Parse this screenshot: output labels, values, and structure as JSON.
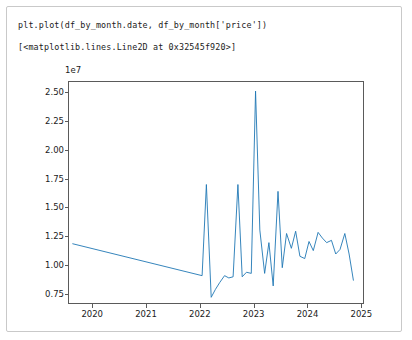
{
  "cell": {
    "input_line": "plt.plot(df_by_month.date, df_by_month['price'])",
    "output_line": "[<matplotlib.lines.Line2D at 0x32545f920>]"
  },
  "figure": {
    "offset_label": "1e7",
    "line_color": "#1f77b4",
    "axis_color": "#5a5a5a",
    "background": "#ffffff"
  },
  "chart_data": {
    "type": "line",
    "title": "",
    "xlabel": "",
    "ylabel": "",
    "offset_text": "1e7",
    "grid": false,
    "legend": null,
    "xtick_labels": [
      "2020",
      "2021",
      "2022",
      "2023",
      "2024",
      "2025"
    ],
    "xtick_values": [
      2020,
      2021,
      2022,
      2023,
      2024,
      2025
    ],
    "ytick_labels": [
      "0.75",
      "1.00",
      "1.25",
      "1.50",
      "1.75",
      "2.00",
      "2.25",
      "2.50"
    ],
    "ytick_values": [
      7500000,
      10000000,
      12500000,
      15000000,
      17500000,
      20000000,
      22500000,
      25000000
    ],
    "xlim": [
      2019.55,
      2025.05
    ],
    "ylim": [
      6600000,
      26000000
    ],
    "series": [
      {
        "name": "price",
        "x": [
          2019.62,
          2022.04,
          2022.12,
          2022.21,
          2022.29,
          2022.37,
          2022.46,
          2022.54,
          2022.62,
          2022.71,
          2022.79,
          2022.87,
          2022.96,
          2023.04,
          2023.12,
          2023.21,
          2023.29,
          2023.37,
          2023.46,
          2023.54,
          2023.62,
          2023.71,
          2023.79,
          2023.87,
          2023.96,
          2024.04,
          2024.12,
          2024.21,
          2024.29,
          2024.37,
          2024.46,
          2024.54,
          2024.62,
          2024.71,
          2024.79,
          2024.87
        ],
        "y": [
          11800000,
          9000000,
          17000000,
          7100000,
          7800000,
          8400000,
          9000000,
          8800000,
          8900000,
          17000000,
          8900000,
          9300000,
          9200000,
          25200000,
          13000000,
          9200000,
          11900000,
          8100000,
          16400000,
          9700000,
          12700000,
          11400000,
          12900000,
          10700000,
          10500000,
          12000000,
          11200000,
          12800000,
          12300000,
          11900000,
          12100000,
          10900000,
          11300000,
          12700000,
          10900000,
          8600000
        ]
      }
    ]
  }
}
